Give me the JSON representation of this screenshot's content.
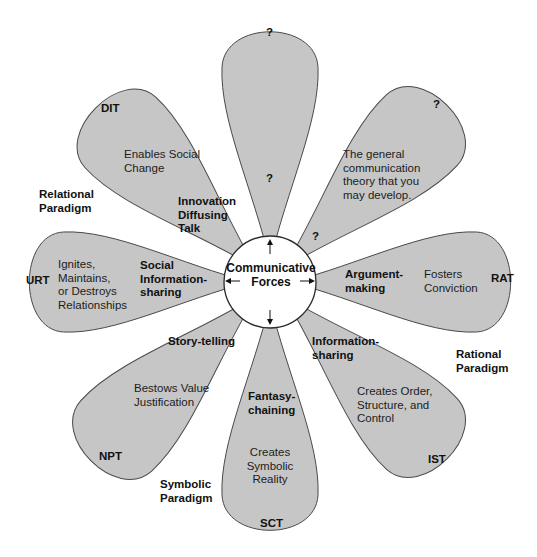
{
  "center": {
    "label_line1": "Communicative",
    "label_line2": "Forces"
  },
  "petals": [
    {
      "id": "top",
      "theory": "?",
      "inner": "?",
      "force": "",
      "effect": ""
    },
    {
      "id": "upper-right",
      "theory": "?",
      "force": "?",
      "effect": "The general\ncommunication\ntheory that you\nmay develop."
    },
    {
      "id": "right",
      "theory": "RAT",
      "force": "Argument-\nmaking",
      "effect": "Fosters\nConviction"
    },
    {
      "id": "lower-right",
      "theory": "IST",
      "force": "Information-\nsharing",
      "effect": "Creates Order,\nStructure, and\nControl"
    },
    {
      "id": "bottom",
      "theory": "SCT",
      "force": "Fantasy-\nchaining",
      "effect": "Creates\nSymbolic\nReality"
    },
    {
      "id": "lower-left",
      "theory": "NPT",
      "force": "Story-telling",
      "effect": "Bestows Value\nJustification"
    },
    {
      "id": "left",
      "theory": "URT",
      "force": "Social\nInformation-\nsharing",
      "effect": "Ignites,\nMaintains,\nor Destroys\nRelationships"
    },
    {
      "id": "upper-left",
      "theory": "DIT",
      "force": "Innovation\nDiffusing\nTalk",
      "effect": "Enables Social\nChange"
    }
  ],
  "paradigms": {
    "relational": "Relational\nParadigm",
    "rational": "Rational\nParadigm",
    "symbolic": "Symbolic\nParadigm"
  }
}
